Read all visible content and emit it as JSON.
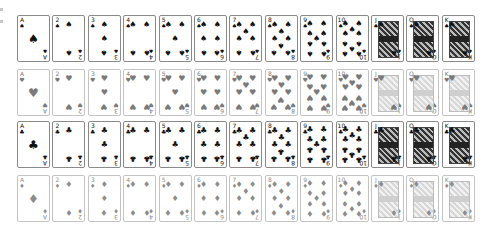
{
  "ranks": [
    "A",
    "2",
    "3",
    "4",
    "5",
    "6",
    "7",
    "8",
    "9",
    "10",
    "J",
    "Q",
    "K"
  ],
  "suits": [
    {
      "name": "spades",
      "glyph": "♠",
      "color": "#111111",
      "row": 0,
      "icon": "spade-icon"
    },
    {
      "name": "hearts",
      "glyph": "♥",
      "color": "#7a7a7a",
      "row": 1,
      "icon": "heart-icon"
    },
    {
      "name": "clubs",
      "glyph": "♣",
      "color": "#111111",
      "row": 2,
      "icon": "club-icon"
    },
    {
      "name": "diamonds",
      "glyph": "♦",
      "color": "#8c8c8c",
      "row": 3,
      "icon": "diamond-icon"
    }
  ],
  "layout": {
    "col_start": 17,
    "col_pitch": 35.4,
    "row_tops": [
      15,
      69,
      121,
      175
    ],
    "card_w": 33,
    "card_h": 47
  },
  "colors": {
    "black_border": "#8a8a8a",
    "red_border": "#c4c4c4",
    "background": "#ffffff"
  }
}
